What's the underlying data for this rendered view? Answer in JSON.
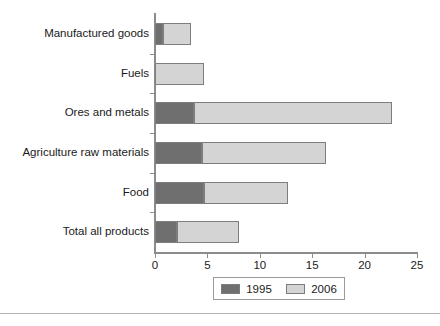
{
  "chart_data": {
    "type": "bar",
    "orientation": "horizontal",
    "stacked": false,
    "title": "",
    "subtitle": "",
    "xlabel": "",
    "ylabel": "",
    "xlim": [
      0,
      25
    ],
    "xticks": [
      0,
      5,
      10,
      15,
      20,
      25
    ],
    "xtick_labels": [
      "0",
      "5",
      "10",
      "15",
      "20",
      "25"
    ],
    "grid": false,
    "legend_position": "bottom-center",
    "categories": [
      "Manufactured goods",
      "Fuels",
      "Ores and metals",
      "Agriculture raw materials",
      "Food",
      "Total all products"
    ],
    "series": [
      {
        "name": "1995",
        "color": "#6f6f6f",
        "values": [
          0.8,
          0.0,
          3.7,
          4.5,
          4.7,
          2.1
        ]
      },
      {
        "name": "2006",
        "color": "#d4d4d4",
        "values": [
          3.4,
          4.7,
          22.6,
          16.3,
          12.7,
          8.0
        ]
      }
    ]
  },
  "legend": {
    "entries": [
      {
        "label": "1995",
        "color": "#6f6f6f"
      },
      {
        "label": "2006",
        "color": "#d4d4d4"
      }
    ]
  },
  "axis": {
    "tick_labels": [
      "0",
      "5",
      "10",
      "15",
      "20",
      "25"
    ]
  },
  "categories": [
    {
      "label": "Manufactured goods"
    },
    {
      "label": "Fuels"
    },
    {
      "label": "Ores and metals"
    },
    {
      "label": "Agriculture raw materials"
    },
    {
      "label": "Food"
    },
    {
      "label": "Total all products"
    }
  ]
}
